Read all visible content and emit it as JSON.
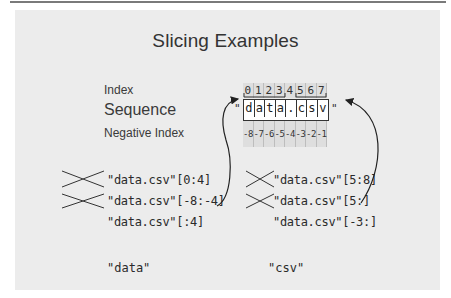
{
  "title": "Slicing Examples",
  "labels": {
    "index": "Index",
    "sequence": "Sequence",
    "negative_index": "Negative Index"
  },
  "sequence": {
    "open_quote": "\"",
    "close_quote": "\"",
    "indices": [
      "0",
      "1",
      "2",
      "3",
      "4",
      "5",
      "6",
      "7"
    ],
    "chars": [
      "d",
      "a",
      "t",
      "a",
      ".",
      "c",
      "s",
      "v"
    ],
    "negative_indices": [
      "-8",
      "-7",
      "-6",
      "-5",
      "-4",
      "-3",
      "-2",
      "-1"
    ]
  },
  "left_examples": [
    {
      "code": "\"data.csv\"[0:4]",
      "crossed": true
    },
    {
      "code": "\"data.csv\"[-8:-4]",
      "crossed": true
    },
    {
      "code": "\"data.csv\"[:4]",
      "crossed": false
    }
  ],
  "right_examples": [
    {
      "code": "\"data.csv\"[5:8]",
      "crossed": true
    },
    {
      "code": "\"data.csv\"[5:]",
      "crossed": true
    },
    {
      "code": "\"data.csv\"[-3:]",
      "crossed": false
    }
  ],
  "results": {
    "left": "\"data\"",
    "right": "\"csv\""
  },
  "colors": {
    "panel_bg": "#ececec",
    "cell_bg": "#dedede",
    "text": "#2a2a2a",
    "border": "#333333"
  }
}
